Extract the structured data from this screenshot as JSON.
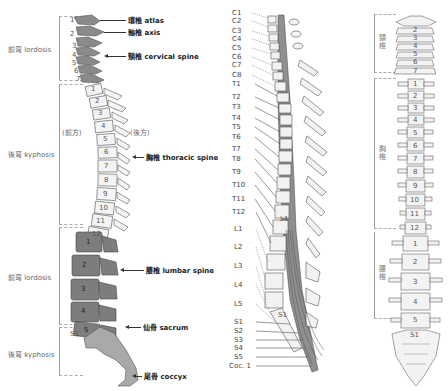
{
  "left_diagram": {
    "regions": [
      {
        "label": "前弯 lordosis",
        "top": 15,
        "bottom": 80
      },
      {
        "label": "後弯 kyphosis",
        "top": 85,
        "bottom": 225
      },
      {
        "label": "前弯 lordosis",
        "top": 228,
        "bottom": 325
      },
      {
        "label": "後弯 kyphosis",
        "top": 328,
        "bottom": 375
      }
    ],
    "direction_labels": {
      "front": "(前方)",
      "back": "(後方)"
    },
    "cervical_numbers": [
      "1",
      "2",
      "3",
      "4",
      "5",
      "6",
      "7"
    ],
    "thoracic_numbers": [
      "1",
      "2",
      "3",
      "4",
      "5",
      "6",
      "7",
      "8",
      "9",
      "10",
      "11",
      "12"
    ],
    "lumbar_numbers": [
      "1",
      "2",
      "3",
      "4",
      "5"
    ],
    "sacral_label": "S1",
    "callouts": [
      {
        "id": "atlas",
        "text": "環椎 atlas"
      },
      {
        "id": "axis",
        "text": "軸椎 axis"
      },
      {
        "id": "cervical",
        "text": "頸椎 cervical spine"
      },
      {
        "id": "thoracic",
        "text": "胸椎 thoracic spine"
      },
      {
        "id": "lumbar",
        "text": "腰椎 lumbar spine"
      },
      {
        "id": "sacrum",
        "text": "仙骨 sacrum"
      },
      {
        "id": "coccyx",
        "text": "尾骨 coccyx"
      }
    ],
    "colors": {
      "cervical": "#8a8a8a",
      "thoracic": "#f4f4f4",
      "lumbar": "#7d7d7d",
      "sacrum": "#a9a9a9",
      "outline": "#555555"
    }
  },
  "middle_diagram": {
    "cervical_nerves": [
      "C1",
      "C2",
      "C3",
      "C4",
      "C5",
      "C6",
      "C7",
      "C8"
    ],
    "thoracic_nerves": [
      "T1",
      "T2",
      "T3",
      "T4",
      "T5",
      "T6",
      "T7",
      "T8",
      "T9",
      "T10",
      "T11",
      "T12"
    ],
    "lumbar_nerves": [
      "L1",
      "L2",
      "L3",
      "L4",
      "L5"
    ],
    "sacral_nerves": [
      "S1",
      "S2",
      "S3",
      "S4",
      "S5"
    ],
    "coccygeal_nerve": "Coc. 1",
    "vertebra_labels": {
      "l1": "L1",
      "s1": "S1"
    }
  },
  "right_diagram": {
    "regions": [
      {
        "label": "頸椎"
      },
      {
        "label": "胸椎"
      },
      {
        "label": "腰椎"
      }
    ],
    "cervical_numbers": [
      "1",
      "2",
      "3",
      "4",
      "5",
      "6",
      "7"
    ],
    "thoracic_numbers": [
      "1",
      "2",
      "3",
      "4",
      "5",
      "6",
      "7",
      "8",
      "9",
      "10",
      "11",
      "12"
    ],
    "lumbar_numbers": [
      "1",
      "2",
      "3",
      "4",
      "5"
    ],
    "sacral_label": "S1"
  }
}
